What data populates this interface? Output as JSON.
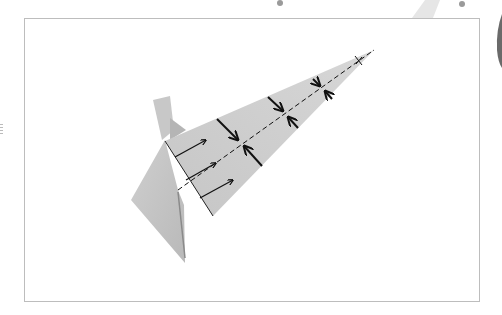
{
  "diagram": {
    "type": "origami-fold-instruction",
    "colors": {
      "paper": "#c9c9c9",
      "paper_shadow": "#a9a9a9",
      "frame_border": "#bdbdbd",
      "lines": "#111111",
      "background": "#ffffff"
    },
    "elements": {
      "fold_line": "dashed valley fold along the center of the long flap",
      "pinch_arrows_pairs": 4,
      "push_arrows": 3,
      "tip_mark": "x"
    }
  }
}
